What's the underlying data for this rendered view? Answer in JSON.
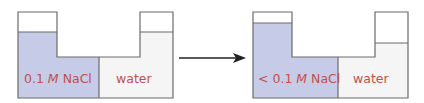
{
  "colors": {
    "solution_fill": "#c6cce7",
    "water_fill": "#f5f5f5",
    "outline": "#6b6b6b",
    "label_text": "#c0504d",
    "arrow": "#222222"
  },
  "before": {
    "left_label_prefix": "",
    "left_label_num": "0.1 ",
    "left_label_unit": "M",
    "left_label_suffix": " NaCl",
    "right_label": "water"
  },
  "after": {
    "left_label_prefix": "< ",
    "left_label_num": "0.1 ",
    "left_label_unit": "M",
    "left_label_suffix": " NaCl",
    "right_label": "water"
  }
}
